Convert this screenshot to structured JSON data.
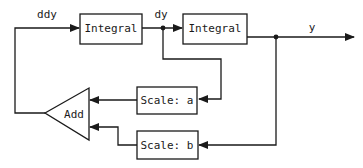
{
  "diagram": {
    "type": "block-diagram",
    "blocks": {
      "integral1": {
        "label": "Integral"
      },
      "integral2": {
        "label": "Integral"
      },
      "scale_a": {
        "label": "Scale: a"
      },
      "scale_b": {
        "label": "Scale: b"
      },
      "add": {
        "label": "Add"
      }
    },
    "signals": {
      "ddy": "ddy",
      "dy": "dy",
      "y": "y"
    },
    "colors": {
      "stroke": "#1a1a1a",
      "background": "#ffffff"
    }
  }
}
